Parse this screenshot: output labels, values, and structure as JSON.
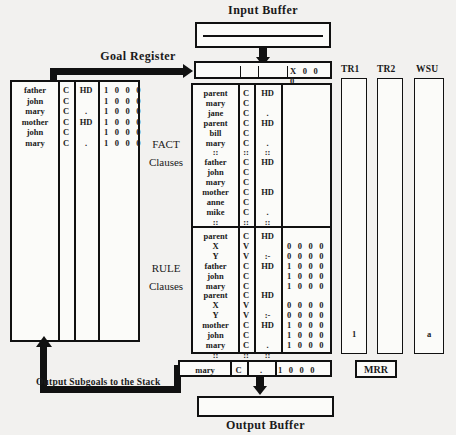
{
  "diagram": {
    "title_input_buffer": "Input Buffer",
    "title_output_buffer": "Output Buffer",
    "label_goal_register": "Goal Register",
    "label_output_subgoals": "Output Subgoals to the Stack",
    "label_fact": "FACT",
    "label_fact_clauses": "Clauses",
    "label_rule": "RULE",
    "label_rule_clauses": "Clauses",
    "label_tr1": "TR1",
    "label_tr2": "TR2",
    "label_wsu": "WSU",
    "label_mrr": "MRR",
    "colors": {
      "ink": "#111111",
      "paper": "#fbfbf9",
      "background": "#f2f1ef"
    }
  },
  "goal_register": {
    "name": "goal-register",
    "value_bits": "X 0 0 0",
    "divider_count": 2
  },
  "stack_panel": {
    "name": "stack",
    "rows": [
      {
        "term": "father",
        "type": "C",
        "mark": "HD",
        "bits": "1 0 0 0"
      },
      {
        "term": "john",
        "type": "C",
        "mark": "",
        "bits": "1 0 0 0"
      },
      {
        "term": "mary",
        "type": "C",
        "mark": ".",
        "bits": "1 0 0 0"
      },
      {
        "term": "mother",
        "type": "C",
        "mark": "HD",
        "bits": "1 0 0 0"
      },
      {
        "term": "john",
        "type": "C",
        "mark": "",
        "bits": "1 0 0 0"
      },
      {
        "term": "mary",
        "type": "C",
        "mark": ".",
        "bits": "1 0 0 0"
      }
    ]
  },
  "fact_clauses": {
    "name": "fact-clauses",
    "rows": [
      {
        "term": "parent",
        "type": "C",
        "mark": "HD",
        "bits": ""
      },
      {
        "term": "mary",
        "type": "C",
        "mark": "",
        "bits": ""
      },
      {
        "term": "jane",
        "type": "C",
        "mark": ".",
        "bits": ""
      },
      {
        "term": "parent",
        "type": "C",
        "mark": "HD",
        "bits": ""
      },
      {
        "term": "bill",
        "type": "C",
        "mark": "",
        "bits": ""
      },
      {
        "term": "mary",
        "type": "C",
        "mark": ".",
        "bits": ""
      },
      {
        "term": "::",
        "type": "::",
        "mark": "::",
        "bits": ""
      },
      {
        "term": "father",
        "type": "C",
        "mark": "HD",
        "bits": ""
      },
      {
        "term": "john",
        "type": "C",
        "mark": "",
        "bits": ""
      },
      {
        "term": "mary",
        "type": "C",
        "mark": "",
        "bits": ""
      },
      {
        "term": "mother",
        "type": "C",
        "mark": "HD",
        "bits": ""
      },
      {
        "term": "anne",
        "type": "C",
        "mark": "",
        "bits": ""
      },
      {
        "term": "mike",
        "type": "C",
        "mark": ".",
        "bits": ""
      },
      {
        "term": "::",
        "type": "::",
        "mark": "::",
        "bits": ""
      }
    ]
  },
  "rule_clauses": {
    "name": "rule-clauses",
    "rows": [
      {
        "term": "parent",
        "type": "C",
        "mark": "HD",
        "bits": ""
      },
      {
        "term": "X",
        "type": "V",
        "mark": "",
        "bits": "0 0 0 0"
      },
      {
        "term": "Y",
        "type": "V",
        "mark": ":-",
        "bits": "0 0 0 0"
      },
      {
        "term": "father",
        "type": "C",
        "mark": "HD",
        "bits": "1 0 0 0"
      },
      {
        "term": "john",
        "type": "C",
        "mark": "",
        "bits": "1 0 0 0"
      },
      {
        "term": "mary",
        "type": "C",
        "mark": "",
        "bits": "1 0 0 0"
      },
      {
        "term": "parent",
        "type": "C",
        "mark": "HD",
        "bits": ""
      },
      {
        "term": "X",
        "type": "V",
        "mark": "",
        "bits": "0 0 0 0"
      },
      {
        "term": "Y",
        "type": "V",
        "mark": ":-",
        "bits": "0 0 0 0"
      },
      {
        "term": "mother",
        "type": "C",
        "mark": "HD",
        "bits": "1 0 0 0"
      },
      {
        "term": "john",
        "type": "C",
        "mark": "",
        "bits": "1 0 0 0"
      },
      {
        "term": "mary",
        "type": "C",
        "mark": ".",
        "bits": "1 0 0 0"
      },
      {
        "term": "::",
        "type": "::",
        "mark": "::",
        "bits": ""
      }
    ]
  },
  "output_row": {
    "name": "output-subgoal-row",
    "term": "mary",
    "type": "C",
    "mark": ".",
    "bits": "1 0 0 0"
  },
  "registers": {
    "tr1": {
      "label": "TR1",
      "value": "1"
    },
    "tr2": {
      "label": "TR2",
      "value": ""
    },
    "wsu": {
      "label": "WSU",
      "value": "a"
    },
    "mrr": {
      "label": "MRR"
    }
  },
  "buffers": {
    "input": {
      "label": "Input Buffer",
      "value": ""
    },
    "output": {
      "label": "Output Buffer",
      "value": ""
    }
  }
}
